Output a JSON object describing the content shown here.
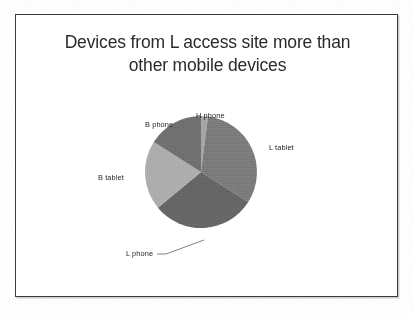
{
  "slide": {
    "title": "Devices from L access site more than\nother mobile devices",
    "background_color": "#ffffff",
    "border_color": "#3a3a3a"
  },
  "chart_data": {
    "type": "pie",
    "title": "Devices from L access site more than other mobile devices",
    "xlabel": "",
    "ylabel": "",
    "legend_position": "none",
    "labels_outside": true,
    "grid": false,
    "start_angle_deg": 0,
    "direction": "clockwise",
    "categories": [
      "H phone",
      "L tablet",
      "L phone",
      "B tablet",
      "B phone"
    ],
    "values": [
      2,
      32,
      30,
      20,
      16
    ],
    "colors": [
      "#a3a3a3",
      "#787878",
      "#636363",
      "#ababab",
      "#6d6d6d"
    ],
    "slices": [
      {
        "label": "H phone",
        "value": 2,
        "color": "#a3a3a3",
        "start_deg": 0,
        "end_deg": 7.2,
        "label_position": "top"
      },
      {
        "label": "L tablet",
        "value": 32,
        "color": "#787878",
        "start_deg": 7.2,
        "end_deg": 122.4,
        "label_position": "right"
      },
      {
        "label": "L phone",
        "value": 30,
        "color": "#636363",
        "start_deg": 122.4,
        "end_deg": 230.4,
        "label_position": "bottom-left-leader"
      },
      {
        "label": "B tablet",
        "value": 20,
        "color": "#ababab",
        "start_deg": 230.4,
        "end_deg": 302.4,
        "label_position": "left"
      },
      {
        "label": "B phone",
        "value": 16,
        "color": "#6d6d6d",
        "start_deg": 302.4,
        "end_deg": 360,
        "label_position": "top-left"
      }
    ]
  },
  "labels": {
    "h_phone": "H phone",
    "l_tablet": "L tablet",
    "l_phone": "L phone",
    "b_tablet": "B tablet",
    "b_phone": "B phone"
  }
}
